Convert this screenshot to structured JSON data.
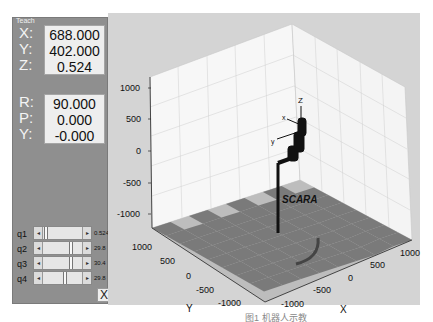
{
  "teach_panel": {
    "title": "Teach",
    "position": [
      {
        "label": "X:",
        "value": "688.000"
      },
      {
        "label": "Y:",
        "value": "402.000"
      },
      {
        "label": "Z:",
        "value": "0.524"
      }
    ],
    "orientation": [
      {
        "label": "R:",
        "value": "90.000"
      },
      {
        "label": "P:",
        "value": "0.000"
      },
      {
        "label": "Y:",
        "value": "-0.000"
      }
    ],
    "joints": [
      {
        "label": "q1",
        "value": "0.524",
        "thumb_pct": 0.04
      },
      {
        "label": "q2",
        "value": "29.8",
        "thumb_pct": 0.55
      },
      {
        "label": "q3",
        "value": "30.4",
        "thumb_pct": 0.55
      },
      {
        "label": "q4",
        "value": "29.8",
        "thumb_pct": 0.45
      }
    ],
    "close_label": "X"
  },
  "plot": {
    "robot_label": "SCARA",
    "z_ticks": [
      "1000",
      "500",
      "0",
      "-500",
      "-1000"
    ],
    "y_ticks": [
      "1000",
      "500",
      "0",
      "-500",
      "-1000"
    ],
    "x_ticks": [
      "-1000",
      "-500",
      "0",
      "500",
      "1000"
    ],
    "y_axis_label": "Y",
    "x_axis_label": "X",
    "frame_labels": {
      "z": "Z",
      "x": "X",
      "y": "Y"
    },
    "colors": {
      "background": "#d4d4d4",
      "wall": "#f7f7f7",
      "grid": "#c8c8c8",
      "tile_dark": "#7a7a7a",
      "tile_light": "#bdbdbd",
      "robot": "#111111"
    }
  },
  "caption": "图1 机器人示教"
}
